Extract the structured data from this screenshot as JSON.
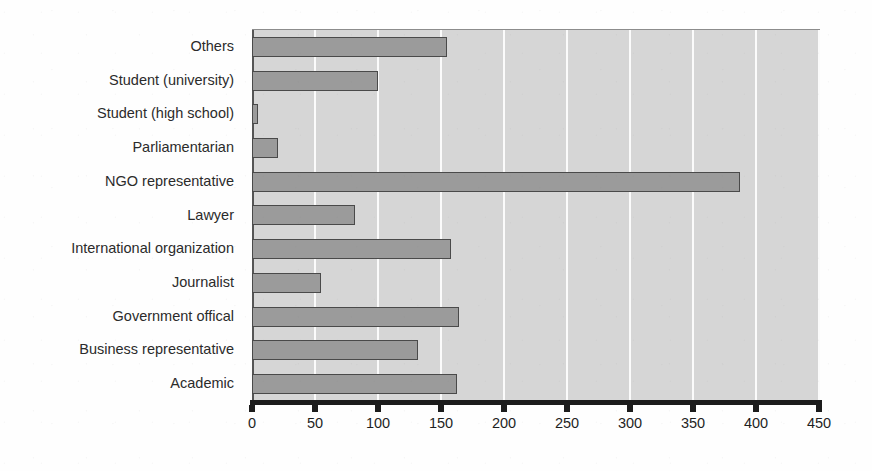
{
  "chart_data": {
    "type": "bar",
    "orientation": "horizontal",
    "title": "",
    "xlabel": "",
    "ylabel": "",
    "xlim": [
      0,
      450
    ],
    "xticks": [
      0,
      50,
      100,
      150,
      200,
      250,
      300,
      350,
      400,
      450
    ],
    "xtick_labels": [
      "0",
      "50",
      "100",
      "150",
      "200",
      "250",
      "300",
      "350",
      "400",
      "450"
    ],
    "grid": true,
    "grid_axis": "x",
    "legend": false,
    "categories": [
      "Others",
      "Student (university)",
      "Student (high school)",
      "Parliamentarian",
      "NGO representative",
      "Lawyer",
      "International organization",
      "Journalist",
      "Government offical",
      "Business representative",
      "Academic"
    ],
    "values": [
      155,
      100,
      5,
      21,
      387,
      82,
      158,
      55,
      164,
      132,
      163
    ],
    "bar_color": "#9b9b9b",
    "bar_edge_color": "#4a4a4a",
    "plot_background": "#d6d6d6",
    "gridline_color": "#fbfbfb",
    "axis_color": "#1c1c1c"
  }
}
